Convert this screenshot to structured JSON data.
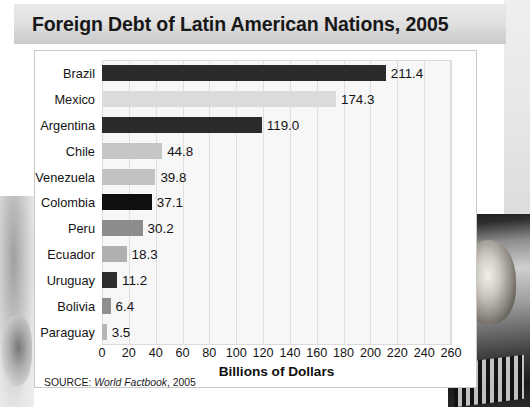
{
  "title": "Foreign Debt of Latin American Nations, 2005",
  "source": {
    "prefix": "SOURCE:",
    "italic": "World Factbook",
    "suffix": ", 2005"
  },
  "colors": {
    "bar_dark": "#2b2b2b",
    "bar_black": "#101010",
    "bar_medium": "#8c8c8c",
    "bar_light": "#c6c6c6",
    "bar_pale": "#dcdcdc",
    "plot_background": "#f7f7f7",
    "gridline": "#dedede",
    "title_band": "#dddddd",
    "text": "#141414"
  },
  "chart_data": {
    "type": "bar",
    "orientation": "horizontal",
    "title": "Foreign Debt of Latin American Nations, 2005",
    "xlabel": "Billions of Dollars",
    "ylabel": "",
    "xlim": [
      0,
      260
    ],
    "xticks": [
      0,
      20,
      40,
      60,
      80,
      100,
      120,
      140,
      160,
      180,
      200,
      220,
      240,
      260
    ],
    "grid": true,
    "legend": "none",
    "categories": [
      "Brazil",
      "Mexico",
      "Argentina",
      "Chile",
      "Venezuela",
      "Colombia",
      "Peru",
      "Ecuador",
      "Uruguay",
      "Bolivia",
      "Paraguay"
    ],
    "values": [
      211.4,
      174.3,
      119.0,
      44.8,
      39.8,
      37.1,
      30.2,
      18.3,
      11.2,
      6.4,
      3.5
    ],
    "value_labels": [
      "211.4",
      "174.3",
      "119.0",
      "44.8",
      "39.8",
      "37.1",
      "30.2",
      "18.3",
      "11.2",
      "6.4",
      "3.5"
    ],
    "bar_colors": [
      "#2b2b2b",
      "#dcdcdc",
      "#2b2b2b",
      "#c6c6c6",
      "#c2c2c2",
      "#101010",
      "#8c8c8c",
      "#b0b0b0",
      "#2e2e2e",
      "#8f8f8f",
      "#b6b6b6"
    ]
  }
}
